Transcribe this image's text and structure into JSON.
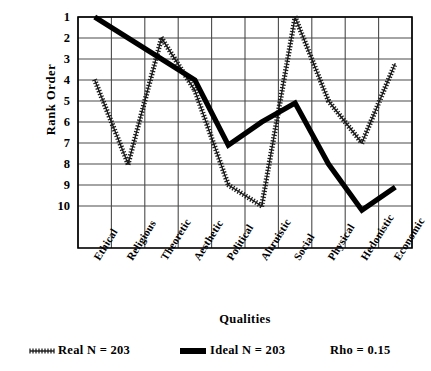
{
  "chart_data": {
    "type": "line",
    "title": "",
    "xlabel": "Qualities",
    "ylabel": "Rank Order",
    "categories": [
      "Ethical",
      "Religious",
      "Theoretic",
      "Aesthetic",
      "Political",
      "Altruistic",
      "Social",
      "Physical",
      "Hedonistic",
      "Economic"
    ],
    "ylim": [
      1,
      10
    ],
    "y_ticks": [
      "1",
      "2",
      "3",
      "4",
      "5",
      "6",
      "7",
      "8",
      "9",
      "10"
    ],
    "y_inverted": true,
    "grid": true,
    "legend_position": "below-plot",
    "series": [
      {
        "name": "Real",
        "label": "Real  N = 203",
        "n": 203,
        "style": "hatched",
        "color": "#1a1a1a",
        "values": [
          4,
          8,
          2,
          4.5,
          9,
          10,
          1,
          5,
          7,
          3.2
        ]
      },
      {
        "name": "Ideal",
        "label": "Ideal  N = 203",
        "n": 203,
        "style": "solid-thick",
        "color": "#000000",
        "values": [
          1,
          2,
          3,
          4,
          7.1,
          6,
          5.1,
          8,
          10.2,
          9.1
        ]
      }
    ],
    "annotations": [
      {
        "name": "rho",
        "text": "Rho = 0.15"
      }
    ]
  },
  "colors": {
    "axis": "#000000",
    "grid": "#4a4a4a",
    "background": "#ffffff",
    "real_series": "#1a1a1a",
    "ideal_series": "#000000"
  }
}
